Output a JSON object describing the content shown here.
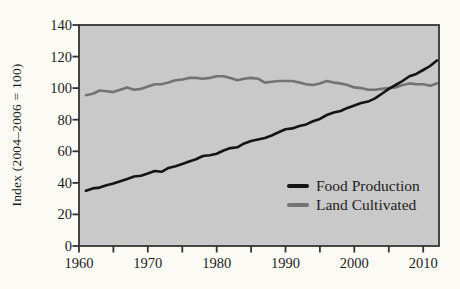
{
  "page": {
    "background": "#fbfaf5",
    "text_color": "#1d1d1d"
  },
  "chart_data": {
    "type": "line",
    "title": "",
    "xlabel": "",
    "ylabel": "Index (2004–2006 = 100)",
    "xlim": [
      1960,
      2012.3
    ],
    "ylim": [
      0,
      140
    ],
    "yticks": [
      0,
      20,
      40,
      60,
      80,
      100,
      120,
      140
    ],
    "xticks_major": [
      1960,
      1970,
      1980,
      1990,
      2000,
      2010
    ],
    "xticks_minor": [
      1965,
      1975,
      1985,
      1995,
      2005
    ],
    "grid": false,
    "plot_bg": "#c9c9c9",
    "frame_color": "#333333",
    "legend_position": "inside lower-right",
    "x": [
      1961,
      1962,
      1963,
      1964,
      1965,
      1966,
      1967,
      1968,
      1969,
      1970,
      1971,
      1972,
      1973,
      1974,
      1975,
      1976,
      1977,
      1978,
      1979,
      1980,
      1981,
      1982,
      1983,
      1984,
      1985,
      1986,
      1987,
      1988,
      1989,
      1990,
      1991,
      1992,
      1993,
      1994,
      1995,
      1996,
      1997,
      1998,
      1999,
      2000,
      2001,
      2002,
      2003,
      2004,
      2005,
      2006,
      2007,
      2008,
      2009,
      2010,
      2011,
      2012
    ],
    "series": [
      {
        "name": "Food Production",
        "color": "#141414",
        "values": [
          35,
          36.5,
          37,
          38.5,
          39.5,
          41,
          42.5,
          44,
          44.5,
          46,
          47.5,
          47,
          49.5,
          50.5,
          52,
          53.5,
          55,
          57,
          57.5,
          58.5,
          60.5,
          62,
          62.5,
          65,
          66.5,
          67.5,
          68.5,
          70,
          72,
          74,
          74.5,
          76,
          77,
          79,
          80.5,
          83,
          84.5,
          85.5,
          87.5,
          89,
          90.5,
          91.5,
          93.5,
          96.5,
          99.5,
          102,
          104.5,
          107.5,
          109,
          111.5,
          114,
          117.5
        ]
      },
      {
        "name": "Land Cultivated",
        "color": "#737373",
        "values": [
          95.5,
          96.5,
          98.5,
          98,
          97.5,
          99,
          100.5,
          99,
          99.5,
          101,
          102.5,
          102.5,
          103.5,
          105,
          105.5,
          106.5,
          106.5,
          106,
          106.5,
          107.5,
          107.5,
          106.5,
          105,
          106,
          106.5,
          106,
          103.5,
          104,
          104.5,
          104.5,
          104.5,
          103.5,
          102.5,
          102,
          103,
          104.5,
          103.5,
          103,
          102,
          100.5,
          100,
          99,
          99,
          99.5,
          100,
          100.5,
          102,
          103,
          102.5,
          102.5,
          101.5,
          103
        ]
      }
    ]
  }
}
